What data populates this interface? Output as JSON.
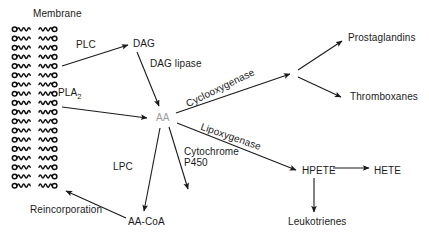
{
  "diagram": {
    "title_label": "Membrane",
    "background": "#ffffff",
    "ink": "#1a1a1a",
    "muted_ink": "#9c9c9c",
    "membrane": {
      "name": "phospholipid-bilayer",
      "rows": 18,
      "units_per_row": 2,
      "label": "Membrane"
    },
    "nodes": [
      {
        "id": "dag",
        "label": "DAG",
        "x": 133,
        "y": 44,
        "color": "#1a1a1a"
      },
      {
        "id": "aa",
        "label": "AA",
        "x": 156,
        "y": 118,
        "color": "#9c9c9c"
      },
      {
        "id": "aa_coa",
        "label": "AA-CoA",
        "x": 128,
        "y": 222,
        "color": "#1a1a1a"
      },
      {
        "id": "prostaglandins",
        "label": "Prostaglandins",
        "x": 348,
        "y": 38,
        "color": "#1a1a1a"
      },
      {
        "id": "thromboxanes",
        "label": "Thromboxanes",
        "x": 350,
        "y": 97,
        "color": "#1a1a1a"
      },
      {
        "id": "hpete",
        "label": "HPETE",
        "x": 302,
        "y": 171,
        "color": "#1a1a1a"
      },
      {
        "id": "hete",
        "label": "HETE",
        "x": 374,
        "y": 171,
        "color": "#1a1a1a"
      },
      {
        "id": "leukotrienes",
        "label": "Leukotrienes",
        "x": 288,
        "y": 222,
        "color": "#1a1a1a"
      }
    ],
    "enzyme_labels": [
      {
        "id": "plc",
        "label": "PLC",
        "x": 76,
        "y": 45
      },
      {
        "id": "pla2",
        "label_main": "PLA",
        "label_sub": "2",
        "x": 58,
        "y": 93
      },
      {
        "id": "dag_lipase",
        "label": "DAG lipase",
        "x": 150,
        "y": 64
      },
      {
        "id": "cyclooxygenase",
        "label": "Cyclooxygenase",
        "x": 189,
        "y": 104
      },
      {
        "id": "lipoxygenase",
        "label": "Lipoxygenase",
        "x": 203,
        "y": 127
      },
      {
        "id": "cytochrome_p450",
        "label_line1": "Cytochrome",
        "label_line2": "P450",
        "x": 184,
        "y": 152
      },
      {
        "id": "lpc",
        "label": "LPC",
        "x": 113,
        "y": 167
      },
      {
        "id": "reincorporation",
        "label": "Reincorporation",
        "x": 30,
        "y": 210
      }
    ],
    "arrows": [
      {
        "id": "membrane-to-dag",
        "from": "membrane",
        "to": "dag"
      },
      {
        "id": "membrane-to-aa",
        "from": "membrane",
        "to": "aa"
      },
      {
        "id": "dag-to-aa",
        "from": "dag",
        "to": "aa"
      },
      {
        "id": "aa-to-cox-branch",
        "from": "aa",
        "to": "cox-branch"
      },
      {
        "id": "cox-to-prostaglandins",
        "from": "cox-branch",
        "to": "prostaglandins"
      },
      {
        "id": "cox-to-thromboxanes",
        "from": "cox-branch",
        "to": "thromboxanes"
      },
      {
        "id": "aa-to-hpete",
        "from": "aa",
        "to": "hpete"
      },
      {
        "id": "hpete-to-hete",
        "from": "hpete",
        "to": "hete"
      },
      {
        "id": "hpete-to-leukotrienes",
        "from": "hpete",
        "to": "leukotrienes"
      },
      {
        "id": "aa-to-cytochrome-p450",
        "from": "aa",
        "to": "p450-terminus"
      },
      {
        "id": "aa-to-aa-coa",
        "from": "aa",
        "to": "aa_coa"
      },
      {
        "id": "aa-coa-to-membrane",
        "from": "aa_coa",
        "to": "membrane"
      }
    ]
  }
}
